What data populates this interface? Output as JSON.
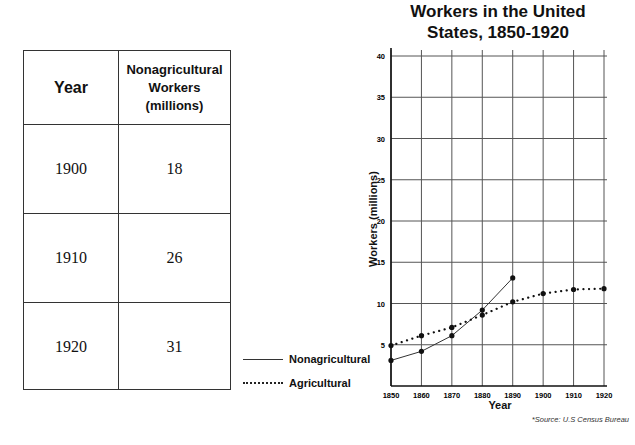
{
  "table": {
    "headers": [
      "Year",
      "Nonagricultural Workers (millions)"
    ],
    "header_lines": [
      "Nonagricultural",
      "Workers",
      "(millions)"
    ],
    "rows": [
      {
        "year": "1900",
        "value": "18"
      },
      {
        "year": "1910",
        "value": "26"
      },
      {
        "year": "1920",
        "value": "31"
      }
    ]
  },
  "chart": {
    "title_line1": "Workers in the United",
    "title_line2": "States, 1850-1920",
    "ylabel": "Workers (millions)",
    "xlabel": "Year",
    "source": "*Source: U.S Census Bureau",
    "legend": {
      "nonag": "Nonagricultural",
      "ag": "Agricultural"
    }
  },
  "chart_data": {
    "type": "line",
    "title": "Workers in the United States, 1850-1920",
    "xlabel": "Year",
    "ylabel": "Workers (millions)",
    "x": [
      1850,
      1860,
      1870,
      1880,
      1890,
      1900,
      1910,
      1920
    ],
    "xticks": [
      "1850",
      "1860",
      "1870",
      "1880",
      "1890",
      "1900",
      "1910",
      "1920"
    ],
    "yticks": [
      5,
      10,
      15,
      20,
      25,
      30,
      35,
      40
    ],
    "ylim": [
      0,
      40
    ],
    "grid": true,
    "legend_position": "left of plot, bottom",
    "series": [
      {
        "name": "Nonagricultural",
        "style": "solid",
        "x": [
          1850,
          1860,
          1870,
          1880,
          1890
        ],
        "values": [
          3.1,
          4.2,
          6.1,
          9.2,
          13.1
        ]
      },
      {
        "name": "Agricultural",
        "style": "dotted",
        "x": [
          1850,
          1860,
          1870,
          1880,
          1890,
          1900,
          1910,
          1920
        ],
        "values": [
          4.9,
          6.1,
          7.1,
          8.6,
          10.2,
          11.2,
          11.7,
          11.8
        ]
      }
    ],
    "source": "*Source: U.S Census Bureau",
    "table": {
      "columns": [
        "Year",
        "Nonagricultural Workers (millions)"
      ],
      "rows": [
        [
          "1900",
          18
        ],
        [
          "1910",
          26
        ],
        [
          "1920",
          31
        ]
      ]
    }
  }
}
